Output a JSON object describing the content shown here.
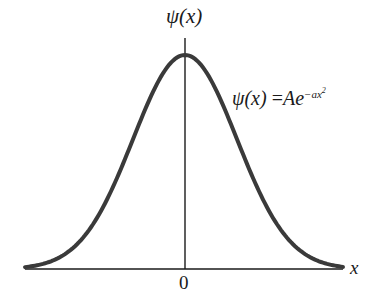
{
  "figure": {
    "y_axis_label": "ψ(x)",
    "x_axis_label": "x",
    "origin_label": "0",
    "equation": {
      "lhs": "ψ(x)",
      "equals": "=",
      "coef": "A",
      "base": "e",
      "exponent": "−ax",
      "exponent_power": "2"
    },
    "curve_color": "#3a3a3a",
    "axis_color": "#1a1a1a"
  },
  "chart_data": {
    "type": "line",
    "title": "",
    "function": "psi(x) = A e^(-a x^2)",
    "xlabel": "x",
    "ylabel": "ψ(x)",
    "x_tick_labels": [
      "0"
    ],
    "grid": false,
    "legend": null,
    "annotations": [
      "ψ(x) = Ae^{-ax^2}"
    ]
  }
}
